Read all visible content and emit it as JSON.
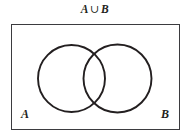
{
  "figure": {
    "name": "venn-diagram-union",
    "title": {
      "left_operand": "A",
      "operator": "∪",
      "right_operand": "B",
      "full_text": "A ∪ B"
    },
    "universe": {
      "label": "",
      "shape": "rectangle"
    },
    "sets": [
      {
        "id": "set-a",
        "label": "A",
        "shape": "circle",
        "position": "left"
      },
      {
        "id": "set-b",
        "label": "B",
        "shape": "circle",
        "position": "right"
      }
    ],
    "colors": {
      "background": "#ffffff",
      "stroke": "#231f20",
      "box_stroke": "#3b3b3f",
      "fill": "none"
    },
    "shading": "none"
  }
}
